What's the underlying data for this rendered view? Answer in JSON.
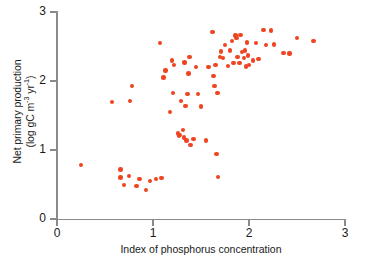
{
  "chart_data": {
    "type": "scatter",
    "title": "",
    "xlabel": "Index of phosphorus concentration",
    "ylabel_line1": "Net primary production",
    "ylabel_line2": "(log gC m",
    "ylabel_sup1": "-3",
    "ylabel_mid": " yr",
    "ylabel_sup2": "-1",
    "ylabel_end": ")",
    "ylabel_plain": "Net primary production (log gC m-3 yr-1)",
    "xlim": [
      0,
      3
    ],
    "ylim": [
      0,
      3
    ],
    "xticks": [
      "0",
      "1",
      "2",
      "3"
    ],
    "xtick_values": [
      0,
      1,
      2,
      3
    ],
    "yticks": [
      "0",
      "1",
      "2",
      "3"
    ],
    "ytick_values": [
      0,
      1,
      2,
      3
    ],
    "grid": false,
    "legend": false,
    "marker_color": "#ee4422",
    "axis_color": "#8a8a8a",
    "n_points": 78,
    "points": [
      [
        0.25,
        0.78
      ],
      [
        0.57,
        1.7
      ],
      [
        0.66,
        0.72
      ],
      [
        0.66,
        0.6
      ],
      [
        0.7,
        0.49
      ],
      [
        0.75,
        0.62
      ],
      [
        0.76,
        1.71
      ],
      [
        0.78,
        1.93
      ],
      [
        0.83,
        0.48
      ],
      [
        0.86,
        0.58
      ],
      [
        0.93,
        0.42
      ],
      [
        0.97,
        0.55
      ],
      [
        1.03,
        0.58
      ],
      [
        1.07,
        2.55
      ],
      [
        1.09,
        0.59
      ],
      [
        1.11,
        2.05
      ],
      [
        1.13,
        2.15
      ],
      [
        1.18,
        1.55
      ],
      [
        1.2,
        2.3
      ],
      [
        1.21,
        1.83
      ],
      [
        1.22,
        2.23
      ],
      [
        1.26,
        1.24
      ],
      [
        1.27,
        1.2
      ],
      [
        1.28,
        1.22
      ],
      [
        1.29,
        1.71
      ],
      [
        1.31,
        1.29
      ],
      [
        1.32,
        1.18
      ],
      [
        1.33,
        2.27
      ],
      [
        1.34,
        1.64
      ],
      [
        1.35,
        1.14
      ],
      [
        1.36,
        1.81
      ],
      [
        1.37,
        2.11
      ],
      [
        1.38,
        2.35
      ],
      [
        1.39,
        1.07
      ],
      [
        1.42,
        1.16
      ],
      [
        1.45,
        2.2
      ],
      [
        1.47,
        1.81
      ],
      [
        1.5,
        1.63
      ],
      [
        1.55,
        1.14
      ],
      [
        1.58,
        2.2
      ],
      [
        1.62,
        2.71
      ],
      [
        1.63,
        2.07
      ],
      [
        1.64,
        1.93
      ],
      [
        1.65,
        2.23
      ],
      [
        1.66,
        0.94
      ],
      [
        1.67,
        1.83
      ],
      [
        1.68,
        0.61
      ],
      [
        1.7,
        2.35
      ],
      [
        1.71,
        2.43
      ],
      [
        1.73,
        2.33
      ],
      [
        1.75,
        2.52
      ],
      [
        1.78,
        2.22
      ],
      [
        1.8,
        2.44
      ],
      [
        1.82,
        2.58
      ],
      [
        1.84,
        2.26
      ],
      [
        1.86,
        2.66
      ],
      [
        1.87,
        2.62
      ],
      [
        1.88,
        2.35
      ],
      [
        1.9,
        2.26
      ],
      [
        1.91,
        2.67
      ],
      [
        1.93,
        2.42
      ],
      [
        1.95,
        2.33
      ],
      [
        1.96,
        2.44
      ],
      [
        1.97,
        2.21
      ],
      [
        1.98,
        2.56
      ],
      [
        1.99,
        2.37
      ],
      [
        2.0,
        2.23
      ],
      [
        2.04,
        2.3
      ],
      [
        2.07,
        2.55
      ],
      [
        2.1,
        2.32
      ],
      [
        2.15,
        2.74
      ],
      [
        2.18,
        2.52
      ],
      [
        2.23,
        2.73
      ],
      [
        2.26,
        2.53
      ],
      [
        2.36,
        2.41
      ],
      [
        2.42,
        2.4
      ],
      [
        2.5,
        2.62
      ],
      [
        2.67,
        2.58
      ]
    ]
  }
}
